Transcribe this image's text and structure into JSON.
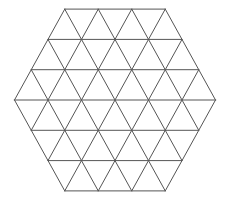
{
  "diagram": {
    "shape": "regular hexagon subdivided into equilateral triangles",
    "subdivisions_per_side": 3,
    "total_small_triangles": 54,
    "center": [
      115,
      100
    ],
    "side_unit_px": 33.5,
    "row_height_px": 30.3,
    "line_color": "#555555",
    "line_width": 1,
    "background": "#ffffff"
  }
}
